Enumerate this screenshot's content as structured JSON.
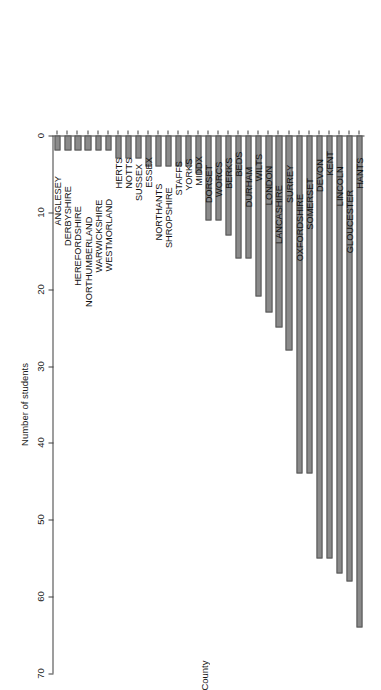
{
  "chart_data": {
    "type": "bar",
    "orientation": "horizontal",
    "title": "",
    "xlabel": "Number of students",
    "ylabel": "County",
    "xlim": [
      0,
      70
    ],
    "xticks": [
      0,
      10,
      20,
      30,
      40,
      50,
      60,
      70
    ],
    "grid": false,
    "legend": false,
    "bar_color": "#8a8a8a",
    "bar_border_color": "#555555",
    "axis_color": "#3c3c3c",
    "categories": [
      "HANTS",
      "GLOUCESTER",
      "LINCOLN",
      "KENT",
      "DEVON",
      "SOMERSET",
      "OXFORDSHIRE",
      "SURREY",
      "LANCASHIRE",
      "LONDON",
      "WILTS",
      "DURHAM",
      "BEDS",
      "BERKS",
      "WORCS",
      "DORSET",
      "MIDDX",
      "YORKS",
      "STAFFS",
      "SHROPSHIRE",
      "NORTHANTS",
      "ESSEX",
      "SUSSEX",
      "NOTTS",
      "HERTS",
      "WESTMORLAND",
      "WARWICKSHIRE",
      "NORTHUMBERLAND",
      "HEREFORDSHIRE",
      "DERBYSHIRE",
      "ANGLESEY"
    ],
    "values": [
      64,
      58,
      57,
      55,
      55,
      44,
      44,
      28,
      25,
      23,
      21,
      16,
      16,
      13,
      11,
      11,
      5,
      4,
      4,
      4,
      4,
      4,
      3,
      3,
      3,
      2,
      2,
      2,
      2,
      2,
      2
    ]
  }
}
